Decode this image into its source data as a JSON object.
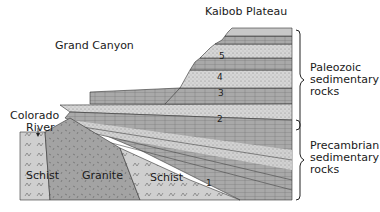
{
  "title": "Grand Canyon",
  "labels": {
    "plateau": "Kaibob Plateau",
    "canyon": "Grand Canyon",
    "river_line1": "Colorado",
    "river_line2": "River",
    "schist_left": "Schist",
    "granite": "Granite",
    "schist_right": "Schist"
  },
  "brackets": [
    {
      "line1": "Paleozoic",
      "line2": "sedimentary",
      "line3": "rocks"
    },
    {
      "line1": "Precambrian",
      "line2": "sedimentary",
      "line3": "rocks"
    }
  ],
  "layer_numbers": [
    "1",
    "2",
    "3",
    "4",
    "5"
  ],
  "colors": {
    "light": "#d4d4d4",
    "mid": "#b5b5b5",
    "dark": "#8f8f8f",
    "outline": "#2a2a2a"
  }
}
